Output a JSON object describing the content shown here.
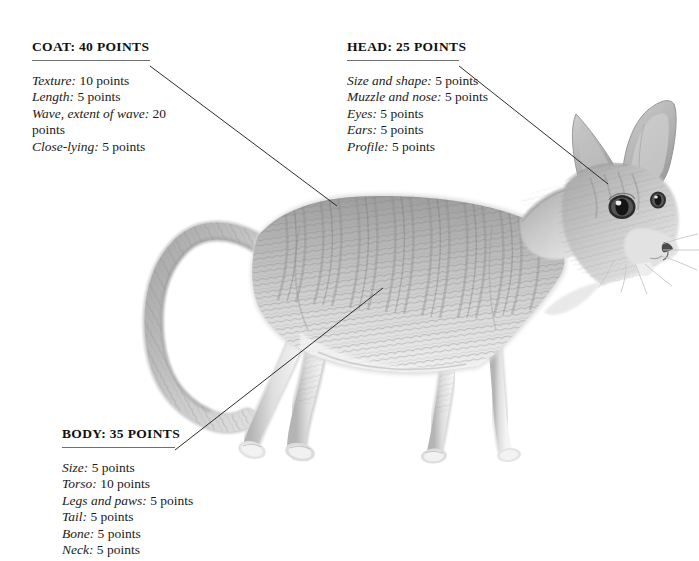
{
  "page": {
    "background_color": "#ffffff"
  },
  "annotations": [
    {
      "id": "coat",
      "title": "COAT: 40 POINTS",
      "items": [
        {
          "label": "Texture:",
          "value": "10 points"
        },
        {
          "label": "Length:",
          "value": "5 points"
        },
        {
          "label": "Wave, extent of wave:",
          "value": "20 points"
        },
        {
          "label": "Close-lying:",
          "value": "5 points"
        }
      ]
    },
    {
      "id": "head",
      "title": "HEAD: 25 POINTS",
      "items": [
        {
          "label": "Size and shape:",
          "value": "5 points"
        },
        {
          "label": "Muzzle and nose:",
          "value": "5 points"
        },
        {
          "label": "Eyes:",
          "value": "5 points"
        },
        {
          "label": "Ears:",
          "value": "5 points"
        },
        {
          "label": "Profile:",
          "value": "5 points"
        }
      ]
    },
    {
      "id": "body",
      "title": "BODY: 35 POINTS",
      "items": [
        {
          "label": "Size:",
          "value": "5 points"
        },
        {
          "label": "Torso:",
          "value": "10 points"
        },
        {
          "label": "Legs and paws:",
          "value": "5 points"
        },
        {
          "label": "Tail:",
          "value": "5 points"
        },
        {
          "label": "Bone:",
          "value": "5 points"
        },
        {
          "label": "Neck:",
          "value": "5 points"
        }
      ]
    }
  ],
  "colors": {
    "rule": "#6f6f6f",
    "leader_line": "#2b2b2b",
    "text": "#1a1a1a",
    "coat_light": "#e9e9e9",
    "coat_mid": "#b8b8b8",
    "coat_dark": "#8e8e8e",
    "coat_shadow": "#6d6d6d"
  }
}
